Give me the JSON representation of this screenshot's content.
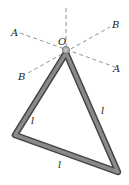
{
  "diagram": {
    "labels": {
      "pivot": "O",
      "axis_a_left": "A",
      "axis_a_right": "A",
      "axis_b_left": "B",
      "axis_b_right": "B",
      "side_left": "l",
      "side_right": "l",
      "side_bottom": "l"
    },
    "colors": {
      "rod": "#6e6e6e",
      "dash": "#777777"
    }
  }
}
